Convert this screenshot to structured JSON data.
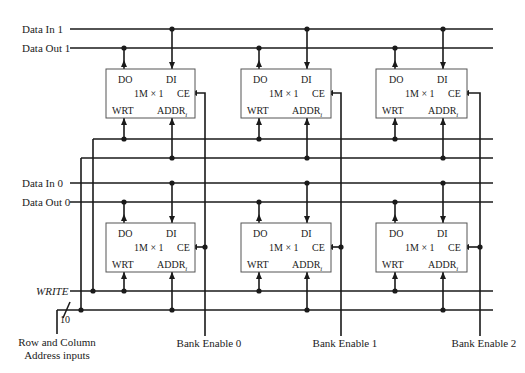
{
  "diagram": {
    "title": "",
    "signals": {
      "data_in_1": "Data In 1",
      "data_out_1": "Data Out 1",
      "data_in_0": "Data In 0",
      "data_out_0": "Data Out 0",
      "write": "WRITE",
      "address_bus_width": "10",
      "address_inputs_line1": "Row and Column",
      "address_inputs_line2": "Address inputs"
    },
    "bank_enables": [
      "Bank Enable 0",
      "Bank Enable 1",
      "Bank Enable 2"
    ],
    "chip": {
      "do": "DO",
      "di": "DI",
      "size": "1M × 1",
      "ce": "CE",
      "wrt": "WRT",
      "addr": "ADDR",
      "addr_sub": "i"
    },
    "rows": 2,
    "columns": 3,
    "colors": {
      "line": "#1a1a1a",
      "box_border": "#555555",
      "background": "#ffffff"
    }
  }
}
